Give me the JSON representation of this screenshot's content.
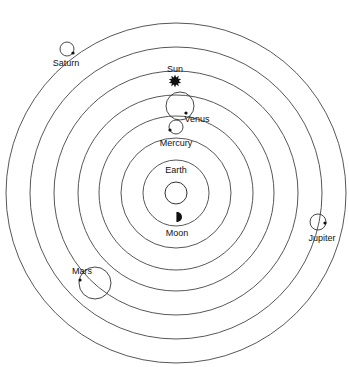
{
  "diagram": {
    "type": "geocentric-model",
    "center": {
      "x": 176,
      "y": 193
    },
    "stroke_color": "#444444",
    "orbits": [
      {
        "name": "moon-orbit",
        "r": 33
      },
      {
        "name": "mercury-orbit",
        "r": 55
      },
      {
        "name": "venus-orbit",
        "r": 77
      },
      {
        "name": "sun-orbit",
        "r": 98
      },
      {
        "name": "mars-orbit",
        "r": 122
      },
      {
        "name": "jupiter-orbit",
        "r": 146
      },
      {
        "name": "saturn-orbit",
        "r": 170
      }
    ],
    "bodies": {
      "earth": {
        "label": "Earth",
        "x": 176,
        "y": 193,
        "r": 11,
        "label_x": 176,
        "label_y": 165
      },
      "moon": {
        "label": "Moon",
        "x": 177,
        "y": 217,
        "label_x": 177,
        "label_y": 228
      },
      "mercury": {
        "label": "Mercury",
        "x": 176,
        "y": 127,
        "r": 7,
        "dot_x": 170,
        "dot_y": 130,
        "label_x": 176,
        "label_y": 138
      },
      "venus": {
        "label": "Venus",
        "x": 180,
        "y": 106,
        "r": 14,
        "dot_x": 186,
        "dot_y": 113,
        "label_x": 197,
        "label_y": 114
      },
      "sun": {
        "label": "Sun",
        "x": 175,
        "y": 81,
        "label_x": 175,
        "label_y": 64
      },
      "mars": {
        "label": "Mars",
        "x": 95,
        "y": 283,
        "r": 16,
        "dot_x": 80,
        "dot_y": 280,
        "label_x": 82,
        "label_y": 266
      },
      "jupiter": {
        "label": "Jupiter",
        "x": 318,
        "y": 222,
        "r": 8,
        "dot_x": 325,
        "dot_y": 223,
        "label_x": 322,
        "label_y": 233
      },
      "saturn": {
        "label": "Saturn",
        "x": 67,
        "y": 49,
        "r": 7,
        "dot_x": 73,
        "dot_y": 53,
        "label_x": 66,
        "label_y": 58
      }
    }
  }
}
